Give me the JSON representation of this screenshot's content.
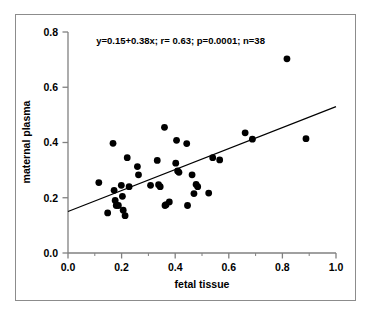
{
  "chart_data": {
    "type": "scatter",
    "title": "",
    "xlabel": "fetal tissue",
    "ylabel": "maternal plasma",
    "xlim": [
      0.0,
      1.0
    ],
    "ylim": [
      0.0,
      0.8
    ],
    "xticks": [
      "0.0",
      "0.2",
      "0.4",
      "0.6",
      "0.8",
      "1.0"
    ],
    "xtick_values": [
      0.0,
      0.2,
      0.4,
      0.6,
      0.8,
      1.0
    ],
    "yticks": [
      "0.0",
      "0.2",
      "0.4",
      "0.6",
      "0.8"
    ],
    "ytick_values": [
      0.0,
      0.2,
      0.4,
      0.6,
      0.8
    ],
    "grid": false,
    "legend": "none",
    "annotation": "y=0.15+0.38x; r= 0.63; p=0.0001; n=38",
    "annotation_x": 0.42,
    "annotation_y": 0.755,
    "regression": {
      "slope": 0.38,
      "intercept": 0.15,
      "r": 0.63,
      "p": 0.0001,
      "n": 38,
      "x_start": 0.0,
      "y_start": 0.15,
      "x_end": 1.0,
      "y_end": 0.53
    },
    "marker": {
      "shape": "circle",
      "color": "#000000",
      "radius_px": 3.4
    },
    "points": [
      {
        "x": 0.115,
        "y": 0.255
      },
      {
        "x": 0.148,
        "y": 0.145
      },
      {
        "x": 0.168,
        "y": 0.397
      },
      {
        "x": 0.172,
        "y": 0.227
      },
      {
        "x": 0.176,
        "y": 0.19
      },
      {
        "x": 0.18,
        "y": 0.172
      },
      {
        "x": 0.188,
        "y": 0.172
      },
      {
        "x": 0.199,
        "y": 0.245
      },
      {
        "x": 0.203,
        "y": 0.205
      },
      {
        "x": 0.206,
        "y": 0.155
      },
      {
        "x": 0.213,
        "y": 0.135
      },
      {
        "x": 0.221,
        "y": 0.345
      },
      {
        "x": 0.228,
        "y": 0.24
      },
      {
        "x": 0.259,
        "y": 0.313
      },
      {
        "x": 0.263,
        "y": 0.283
      },
      {
        "x": 0.308,
        "y": 0.245
      },
      {
        "x": 0.333,
        "y": 0.335
      },
      {
        "x": 0.338,
        "y": 0.247
      },
      {
        "x": 0.344,
        "y": 0.24
      },
      {
        "x": 0.36,
        "y": 0.455
      },
      {
        "x": 0.362,
        "y": 0.172
      },
      {
        "x": 0.366,
        "y": 0.175
      },
      {
        "x": 0.378,
        "y": 0.185
      },
      {
        "x": 0.402,
        "y": 0.325
      },
      {
        "x": 0.405,
        "y": 0.408
      },
      {
        "x": 0.409,
        "y": 0.297
      },
      {
        "x": 0.414,
        "y": 0.292
      },
      {
        "x": 0.443,
        "y": 0.396
      },
      {
        "x": 0.446,
        "y": 0.172
      },
      {
        "x": 0.463,
        "y": 0.283
      },
      {
        "x": 0.47,
        "y": 0.215
      },
      {
        "x": 0.478,
        "y": 0.248
      },
      {
        "x": 0.484,
        "y": 0.24
      },
      {
        "x": 0.525,
        "y": 0.217
      },
      {
        "x": 0.54,
        "y": 0.345
      },
      {
        "x": 0.566,
        "y": 0.337
      },
      {
        "x": 0.661,
        "y": 0.435
      },
      {
        "x": 0.688,
        "y": 0.412
      },
      {
        "x": 0.817,
        "y": 0.703
      },
      {
        "x": 0.888,
        "y": 0.414
      }
    ]
  },
  "colors": {
    "frame_border": "#8c8c8c",
    "axis": "#808080",
    "marker": "#000000",
    "line": "#000000",
    "background": "#ffffff"
  }
}
